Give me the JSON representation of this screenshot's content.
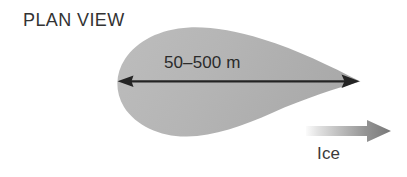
{
  "figure": {
    "title": "PLAN VIEW",
    "length_label": "50–500 m",
    "flow_label": "Ice",
    "colors": {
      "background": "#ffffff",
      "teardrop_fill": "#b3b3b3",
      "teardrop_fill_light": "#bcbcbc",
      "arrow_line": "#262626",
      "text": "#2b2b2b",
      "flow_arrow_dark": "#7c7c7c",
      "flow_arrow_light": "#f2f2f2"
    },
    "shapes": {
      "teardrop": {
        "name": "teardrop-plume",
        "bulb_center_x": 178,
        "bulb_center_y": 82,
        "tip_x": 360,
        "tip_y": 81,
        "left_x": 118,
        "top_y": 27,
        "bottom_y": 137
      },
      "dimension_arrow": {
        "name": "double-headed-dimension-arrow",
        "x1": 119,
        "x2": 357,
        "y": 81
      },
      "flow_arrow": {
        "name": "ice-flow-gradient-arrow",
        "x1": 306,
        "x2": 391,
        "y": 131,
        "shaft_half_height": 5,
        "head_half_height": 11,
        "head_length": 24
      }
    }
  }
}
